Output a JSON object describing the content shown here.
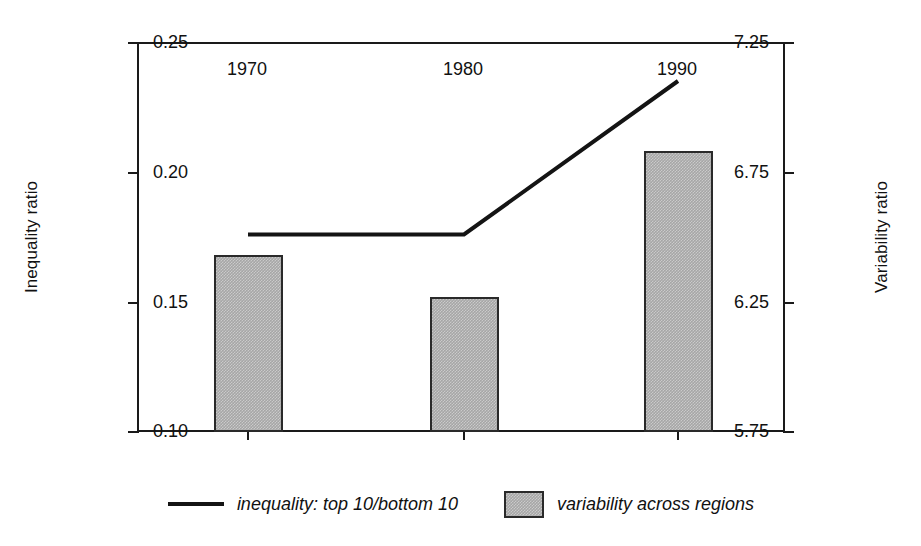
{
  "chart_data": {
    "type": "bar",
    "title": "",
    "subtitle": "",
    "xlabel": "",
    "categories": [
      "1970",
      "1980",
      "1990"
    ],
    "x": [
      1970,
      1980,
      1990
    ],
    "grid": false,
    "legend_position": "bottom",
    "axes": {
      "left": {
        "label": "Inequality ratio",
        "ticks": [
          "7.25",
          "6.75",
          "6.25",
          "5.75"
        ],
        "tick_values": [
          7.25,
          6.75,
          6.25,
          5.75
        ],
        "lim": [
          5.75,
          7.25
        ]
      },
      "right": {
        "label": "Variability ratio",
        "ticks": [
          "0.25",
          "0.20",
          "0.15",
          "0.10"
        ],
        "tick_values": [
          0.25,
          0.2,
          0.15,
          0.1
        ],
        "lim": [
          0.1,
          0.25
        ]
      }
    },
    "series": [
      {
        "name": "inequality: top 10/bottom 10",
        "type": "line",
        "axis": "left",
        "color": "#141414",
        "values": [
          6.51,
          6.51,
          7.1
        ]
      },
      {
        "name": "variability across regions",
        "type": "bar",
        "axis": "right",
        "color": "#a6a6a6",
        "edge_color": "#2a2a2a",
        "values": [
          0.168,
          0.152,
          0.208
        ]
      }
    ]
  },
  "legend": {
    "items": [
      {
        "marker": "line",
        "label": "inequality: top 10/bottom 10"
      },
      {
        "marker": "swatch",
        "label": "variability across regions"
      }
    ]
  }
}
